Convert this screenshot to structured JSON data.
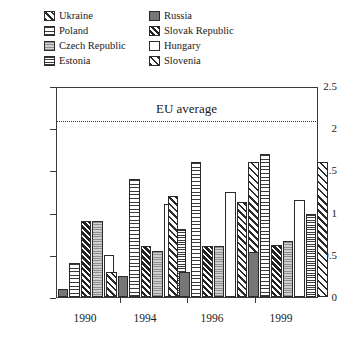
{
  "legend": {
    "items": [
      {
        "label": "Ukraine",
        "key": "ukraine",
        "column": "left"
      },
      {
        "label": "Russia",
        "key": "russia",
        "column": "right"
      },
      {
        "label": "Poland",
        "key": "poland",
        "column": "left"
      },
      {
        "label": "Slovak Republic",
        "key": "slovak",
        "column": "right"
      },
      {
        "label": "Czech Republic",
        "key": "czech",
        "column": "left"
      },
      {
        "label": "Hungary",
        "key": "hungary",
        "column": "right"
      },
      {
        "label": "Estonia",
        "key": "estonia",
        "column": "left"
      },
      {
        "label": "Slovenia",
        "key": "slovenia",
        "column": "right"
      }
    ]
  },
  "annotation": {
    "eu_average_label": "EU average",
    "eu_average_value": 2.1
  },
  "axis": {
    "y_ticks": [
      "0",
      "0.5",
      "1",
      "1.5",
      "2",
      "2.5"
    ],
    "x_ticks": [
      "1990",
      "1994",
      "1996",
      "1999"
    ]
  },
  "chart_data": {
    "type": "bar",
    "title": "",
    "xlabel": "",
    "ylabel": "",
    "ylim": [
      0,
      2.5
    ],
    "ytick_values": [
      0,
      0.5,
      1,
      1.5,
      2,
      2.5
    ],
    "grid": false,
    "legend_position": "top",
    "categories": [
      "1990",
      "1994",
      "1996",
      "1999"
    ],
    "annotations": [
      {
        "text": "EU average",
        "type": "hline",
        "value": 2.1,
        "style": "dotted"
      }
    ],
    "series": [
      {
        "name": "Ukraine",
        "pattern": "diagonal-backslash",
        "values": [
          null,
          0.3,
          1.2,
          1.12
        ]
      },
      {
        "name": "Russia",
        "pattern": "solid-grey",
        "values": [
          0.1,
          0.25,
          0.3,
          0.53
        ]
      },
      {
        "name": "Poland",
        "pattern": "horizontal-sparse",
        "values": [
          0.4,
          1.4,
          1.6,
          1.7
        ]
      },
      {
        "name": "Slovak Republic",
        "pattern": "dark-diagonal",
        "values": [
          0.9,
          0.6,
          0.6,
          0.62
        ]
      },
      {
        "name": "Czech Republic",
        "pattern": "grey-dotted",
        "values": [
          0.9,
          0.55,
          0.6,
          0.66
        ]
      },
      {
        "name": "Hungary",
        "pattern": "white",
        "values": [
          0.5,
          1.1,
          1.25,
          1.15
        ]
      },
      {
        "name": "Estonia",
        "pattern": "horizontal-dense",
        "values": [
          null,
          0.8,
          0.85,
          0.98
        ]
      },
      {
        "name": "Slovenia",
        "pattern": "diagonal-forward",
        "values": [
          null,
          null,
          1.6,
          1.6
        ]
      }
    ]
  },
  "colors": {
    "axis": "#3a3a3a",
    "text": "#1a1a1a",
    "bar_outline": "#2b2b2b",
    "russia_fill": "#767676",
    "czech_fill": "#b9b9b9",
    "slovak_fill": "#222222"
  }
}
